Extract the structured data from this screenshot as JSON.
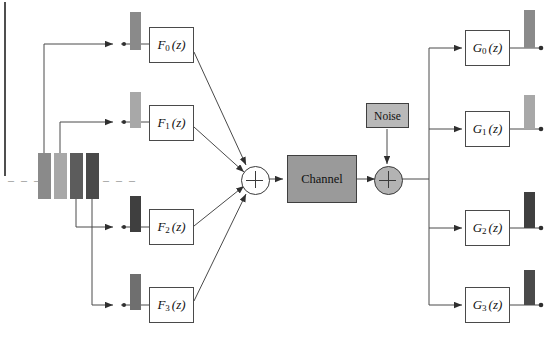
{
  "page": {
    "header_remnant": "",
    "background": "#ffffff"
  },
  "analysis_filters": [
    {
      "label_base": "F",
      "index": "0",
      "arg": "(z)",
      "name": "filter-f0"
    },
    {
      "label_base": "F",
      "index": "1",
      "arg": "(z)",
      "name": "filter-f1"
    },
    {
      "label_base": "F",
      "index": "2",
      "arg": "(z)",
      "name": "filter-f2"
    },
    {
      "label_base": "F",
      "index": "3",
      "arg": "(z)",
      "name": "filter-f3"
    }
  ],
  "synthesis_filters": [
    {
      "label_base": "G",
      "index": "0",
      "arg": "(z)",
      "name": "filter-g0"
    },
    {
      "label_base": "G",
      "index": "1",
      "arg": "(z)",
      "name": "filter-g1"
    },
    {
      "label_base": "G",
      "index": "2",
      "arg": "(z)",
      "name": "filter-g2"
    },
    {
      "label_base": "G",
      "index": "3",
      "arg": "(z)",
      "name": "filter-g3"
    }
  ],
  "blocks": {
    "channel": "Channel",
    "noise": "Noise"
  },
  "adders": {
    "combiner_symbol": "+",
    "noise_adder_symbol": "+"
  },
  "input_spectrum": {
    "ellipsis_left": "–  –  –",
    "ellipsis_right": "–  –  –",
    "bars": [
      {
        "name": "input-band-0",
        "color": "#8a8a8a"
      },
      {
        "name": "input-band-1",
        "color": "#a8a8a8"
      },
      {
        "name": "input-band-2",
        "color": "#5c5c5c"
      },
      {
        "name": "input-band-3",
        "color": "#4a4a4a"
      }
    ]
  },
  "analysis_bars": [
    {
      "name": "analysis-band-bar-0",
      "color": "#8a8a8a"
    },
    {
      "name": "analysis-band-bar-1",
      "color": "#a8a8a8"
    },
    {
      "name": "analysis-band-bar-2",
      "color": "#3f3f3f"
    },
    {
      "name": "analysis-band-bar-3",
      "color": "#6f6f6f"
    }
  ],
  "synthesis_bars": [
    {
      "name": "synthesis-band-bar-0",
      "color": "#8a8a8a"
    },
    {
      "name": "synthesis-band-bar-1",
      "color": "#a8a8a8"
    },
    {
      "name": "synthesis-band-bar-2",
      "color": "#3f3f3f"
    },
    {
      "name": "synthesis-band-bar-3",
      "color": "#4a4a4a"
    }
  ],
  "colors": {
    "line": "#4a4a4a",
    "box_border": "#4a4a4a",
    "channel_fill": "#9a9a9a",
    "noise_fill": "#b9b9b9",
    "adder_fill": "#b3b3b3"
  }
}
